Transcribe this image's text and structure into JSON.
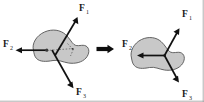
{
  "figure": {
    "background_color": "#ffffff",
    "body_fill_color": "#c8c8c8",
    "body_stroke_color": "#555555",
    "arrow_color": "#111111",
    "label_color": "#1a1a1a",
    "frame_color": "#9a9a9a",
    "width": 204,
    "height": 102
  },
  "left_diagram": {
    "name": "forces-at-separate-points",
    "body_label": "rigid-body-blob",
    "forces": [
      {
        "id": "F1",
        "label": "F",
        "subscript": "1",
        "direction": "up-right",
        "label_x": 79,
        "label_y": 11,
        "sub_x": 86,
        "sub_y": 13.5
      },
      {
        "id": "F2",
        "label": "F",
        "subscript": "2",
        "direction": "left",
        "label_x": 3,
        "label_y": 47,
        "sub_x": 10,
        "sub_y": 49.5
      },
      {
        "id": "F3",
        "label": "F",
        "subscript": "3",
        "direction": "down-right",
        "label_x": 76,
        "label_y": 95,
        "sub_x": 83,
        "sub_y": 97.5
      }
    ],
    "center_line": "dashed-action-line"
  },
  "transition": {
    "name": "implies-arrow",
    "symbol": "⇒",
    "direction": "right"
  },
  "right_diagram": {
    "name": "forces-at-common-point",
    "body_label": "rigid-body-blob",
    "forces": [
      {
        "id": "F1",
        "label": "F",
        "subscript": "1",
        "direction": "up-right",
        "label_x": 182,
        "label_y": 17,
        "sub_x": 189,
        "sub_y": 19.5
      },
      {
        "id": "F2",
        "label": "F",
        "subscript": "2",
        "direction": "left",
        "label_x": 122,
        "label_y": 47,
        "sub_x": 129,
        "sub_y": 49.5
      },
      {
        "id": "F3",
        "label": "F",
        "subscript": "3",
        "direction": "down-right",
        "label_x": 182,
        "label_y": 97,
        "sub_x": 189,
        "sub_y": 99.5
      }
    ],
    "concurrency_point": "single-point-of-application"
  }
}
